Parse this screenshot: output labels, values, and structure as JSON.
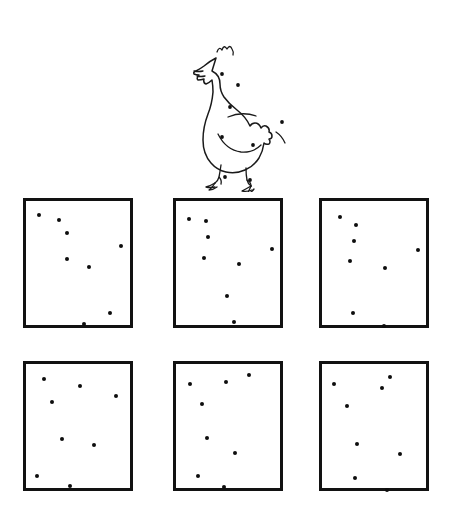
{
  "worksheet": {
    "type": "dot-count-matching",
    "stimulus": {
      "name": "chicken-with-spots",
      "icon": "chicken-icon",
      "spot_count": 8,
      "spots": [
        {
          "id": "head",
          "x": 64,
          "y": 52
        },
        {
          "id": "neck-upper",
          "x": 80,
          "y": 63
        },
        {
          "id": "neck-lower",
          "x": 72,
          "y": 85
        },
        {
          "id": "breast-left",
          "x": 64,
          "y": 115
        },
        {
          "id": "belly",
          "x": 95,
          "y": 123
        },
        {
          "id": "tail",
          "x": 124,
          "y": 100
        },
        {
          "id": "foot-left",
          "x": 67,
          "y": 155
        },
        {
          "id": "foot-right",
          "x": 92,
          "y": 158
        }
      ]
    },
    "options": [
      {
        "id": "option-1",
        "position": "top-left",
        "row": 0,
        "col": 0,
        "dot_count": 8,
        "dots": [
          {
            "x": 13,
            "y": 14
          },
          {
            "x": 33,
            "y": 19
          },
          {
            "x": 41,
            "y": 32
          },
          {
            "x": 41,
            "y": 58
          },
          {
            "x": 63,
            "y": 66
          },
          {
            "x": 95,
            "y": 45
          },
          {
            "x": 84,
            "y": 112
          },
          {
            "x": 58,
            "y": 123
          }
        ]
      },
      {
        "id": "option-2",
        "position": "top-middle",
        "row": 0,
        "col": 1,
        "dot_count": 8,
        "dots": [
          {
            "x": 13,
            "y": 18
          },
          {
            "x": 30,
            "y": 20
          },
          {
            "x": 32,
            "y": 36
          },
          {
            "x": 28,
            "y": 57
          },
          {
            "x": 63,
            "y": 63
          },
          {
            "x": 96,
            "y": 48
          },
          {
            "x": 51,
            "y": 95
          },
          {
            "x": 58,
            "y": 121
          }
        ]
      },
      {
        "id": "option-3",
        "position": "top-right",
        "row": 0,
        "col": 2,
        "dot_count": 8,
        "dots": [
          {
            "x": 18,
            "y": 16
          },
          {
            "x": 34,
            "y": 24
          },
          {
            "x": 32,
            "y": 40
          },
          {
            "x": 28,
            "y": 60
          },
          {
            "x": 63,
            "y": 67
          },
          {
            "x": 96,
            "y": 49
          },
          {
            "x": 31,
            "y": 112
          },
          {
            "x": 62,
            "y": 125
          }
        ]
      },
      {
        "id": "option-4",
        "position": "bottom-left",
        "row": 1,
        "col": 0,
        "dot_count": 8,
        "dots": [
          {
            "x": 18,
            "y": 15
          },
          {
            "x": 54,
            "y": 22
          },
          {
            "x": 90,
            "y": 32
          },
          {
            "x": 26,
            "y": 38
          },
          {
            "x": 36,
            "y": 75
          },
          {
            "x": 68,
            "y": 81
          },
          {
            "x": 11,
            "y": 112
          },
          {
            "x": 44,
            "y": 122
          }
        ]
      },
      {
        "id": "option-5",
        "position": "bottom-middle",
        "row": 1,
        "col": 1,
        "dot_count": 8,
        "dots": [
          {
            "x": 14,
            "y": 20
          },
          {
            "x": 50,
            "y": 18
          },
          {
            "x": 73,
            "y": 11
          },
          {
            "x": 26,
            "y": 40
          },
          {
            "x": 31,
            "y": 74
          },
          {
            "x": 59,
            "y": 89
          },
          {
            "x": 22,
            "y": 112
          },
          {
            "x": 48,
            "y": 123
          }
        ]
      },
      {
        "id": "option-6",
        "position": "bottom-right",
        "row": 1,
        "col": 2,
        "dot_count": 8,
        "dots": [
          {
            "x": 12,
            "y": 20
          },
          {
            "x": 60,
            "y": 24
          },
          {
            "x": 68,
            "y": 13
          },
          {
            "x": 25,
            "y": 42
          },
          {
            "x": 35,
            "y": 80
          },
          {
            "x": 78,
            "y": 90
          },
          {
            "x": 33,
            "y": 114
          },
          {
            "x": 65,
            "y": 126
          }
        ]
      }
    ]
  },
  "colors": {
    "ink": "#121212",
    "dot": "#0d0d0d",
    "paper": "#ffffff"
  }
}
